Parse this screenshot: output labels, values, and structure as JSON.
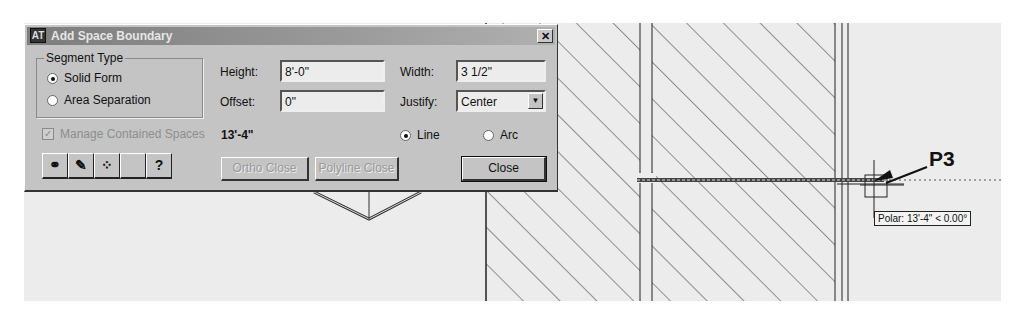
{
  "dialog": {
    "title": "Add Space Boundary",
    "app_icon": "AT",
    "close_glyph": "✕",
    "segment_type": {
      "legend": "Segment Type",
      "options": [
        {
          "label": "Solid Form",
          "selected": true
        },
        {
          "label": "Area Separation",
          "selected": false
        }
      ]
    },
    "height": {
      "label": "Height:",
      "value": "8'-0\""
    },
    "offset": {
      "label": "Offset:",
      "value": "0\""
    },
    "width": {
      "label": "Width:",
      "value": "3 1/2\""
    },
    "justify": {
      "label": "Justify:",
      "value": "Center"
    },
    "manage_contained": {
      "label": "Manage Contained Spaces",
      "checked": true,
      "disabled": true
    },
    "length_readout": "13'-4\"",
    "segment_shape": [
      {
        "label": "Line",
        "selected": true
      },
      {
        "label": "Arc",
        "selected": false
      }
    ],
    "toolbar": [
      {
        "icon": "match-properties-icon",
        "glyph": "⚭"
      },
      {
        "icon": "paint-brush-icon",
        "glyph": "✎"
      },
      {
        "icon": "style-icon",
        "glyph": "⁘"
      },
      {
        "icon": "blank-icon",
        "glyph": ""
      },
      {
        "icon": "help-icon",
        "glyph": "?"
      }
    ],
    "buttons": {
      "ortho_close": "Ortho Close",
      "polyline_close": "Polyline Close",
      "close": "Close"
    }
  },
  "drawing": {
    "callout_label": "P3",
    "polar_tooltip": "Polar: 13'-4\" < 0.00°"
  }
}
